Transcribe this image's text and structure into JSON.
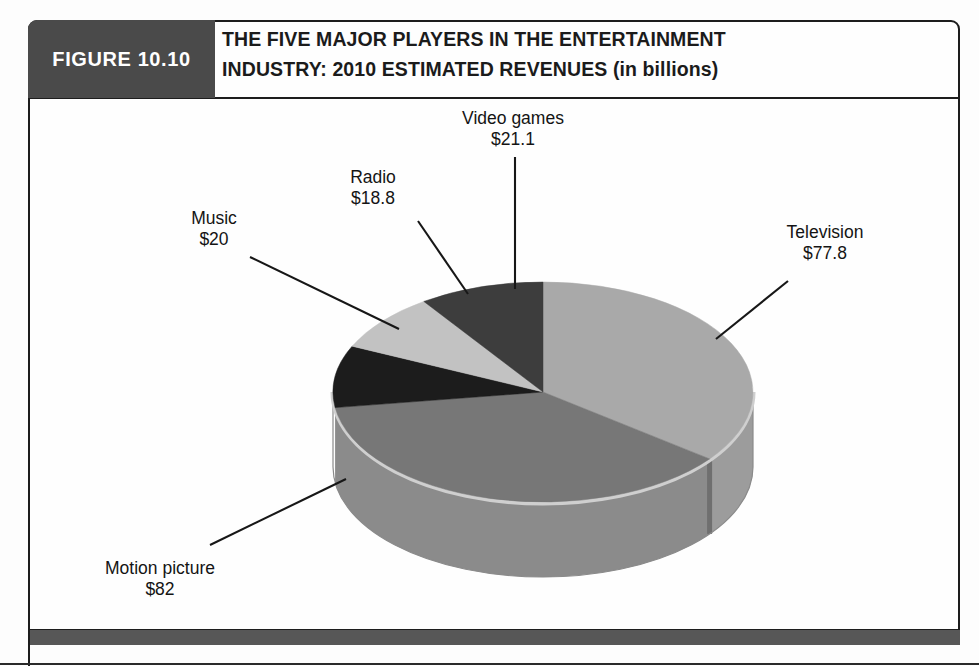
{
  "figure": {
    "number_label": "FIGURE 10.10",
    "title_line1": "THE FIVE MAJOR PLAYERS IN THE ENTERTAINMENT",
    "title_line2": "INDUSTRY: 2010 ESTIMATED REVENUES (in billions)"
  },
  "labels": {
    "video_games": {
      "name": "Video games",
      "value": "$21.1"
    },
    "radio": {
      "name": "Radio",
      "value": "$18.8"
    },
    "music": {
      "name": "Music",
      "value": "$20"
    },
    "television": {
      "name": "Television",
      "value": "$77.8"
    },
    "motion_picture": {
      "name": "Motion picture",
      "value": "$82"
    }
  },
  "colors": {
    "frame_border": "#1d1d1d",
    "figure_tab_bg": "#4a4a4a",
    "bottom_bar": "#575757",
    "slice_television": "#a9a9a9",
    "slice_motion_picture": "#777777",
    "slice_music": "#1c1c1c",
    "slice_radio": "#c2c2c2",
    "slice_video_games": "#3d3d3d",
    "side_wall": "#8f8f8f",
    "rim_highlight": "#c9c9c9",
    "leader_line": "#171717",
    "text": "#141414"
  },
  "chart_data": {
    "type": "pie",
    "title": "THE FIVE MAJOR PLAYERS IN THE ENTERTAINMENT INDUSTRY: 2010 ESTIMATED REVENUES (in billions)",
    "unit": "billions of US dollars",
    "value_prefix": "$",
    "total": 219.7,
    "three_d": true,
    "start_angle_deg": 0,
    "direction": "clockwise",
    "legend": "none (labels with leader lines)",
    "grid": false,
    "categories": [
      "Television",
      "Motion picture",
      "Music",
      "Radio",
      "Video games"
    ],
    "values": [
      77.8,
      82,
      20,
      18.8,
      21.1
    ],
    "slices": [
      {
        "label": "Television",
        "value": 77.8,
        "value_text": "$77.8",
        "percent": 35.4,
        "angle_deg": 127.5,
        "color": "#a9a9a9"
      },
      {
        "label": "Motion picture",
        "value": 82.0,
        "value_text": "$82",
        "percent": 37.3,
        "angle_deg": 134.3,
        "color": "#777777"
      },
      {
        "label": "Music",
        "value": 20.0,
        "value_text": "$20",
        "percent": 9.1,
        "angle_deg": 32.8,
        "color": "#1c1c1c"
      },
      {
        "label": "Radio",
        "value": 18.8,
        "value_text": "$18.8",
        "percent": 8.6,
        "angle_deg": 30.8,
        "color": "#c2c2c2"
      },
      {
        "label": "Video games",
        "value": 21.1,
        "value_text": "$21.1",
        "percent": 9.6,
        "angle_deg": 34.6,
        "color": "#3d3d3d"
      }
    ]
  }
}
